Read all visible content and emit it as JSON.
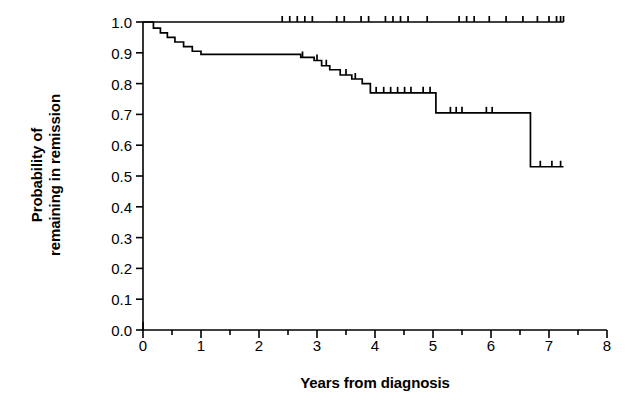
{
  "chart_data": {
    "type": "line",
    "title": "",
    "xlabel": "Years from diagnosis",
    "ylabel_lines": [
      "Probability of",
      "remaining in remission"
    ],
    "ylabel": "Probability of remaining in remission",
    "xlim": [
      0,
      8
    ],
    "ylim": [
      0.0,
      1.0
    ],
    "xticks": [
      0,
      1,
      2,
      3,
      4,
      5,
      6,
      7,
      8
    ],
    "xtick_labels": [
      "0",
      "1",
      "2",
      "3",
      "4",
      "5",
      "6",
      "7",
      "8"
    ],
    "xminor_step": 0.5,
    "yticks": [
      0.0,
      0.1,
      0.2,
      0.3,
      0.4,
      0.5,
      0.6,
      0.7,
      0.8,
      0.9,
      1.0
    ],
    "ytick_labels": [
      "0.0",
      "0.1",
      "0.2",
      "0.3",
      "0.4",
      "0.5",
      "0.6",
      "0.7",
      "0.8",
      "0.9",
      "1.0"
    ],
    "grid": false,
    "legend": "none",
    "step_style": "post",
    "line_color": "#000000",
    "series": [
      {
        "name": "upper-curve",
        "x": [
          0.0,
          7.25
        ],
        "y": [
          1.0,
          1.0
        ],
        "censor_x": [
          2.4,
          2.53,
          2.66,
          2.79,
          2.92,
          3.34,
          3.47,
          3.76,
          3.89,
          4.18,
          4.31,
          4.44,
          4.57,
          4.9,
          5.45,
          5.58,
          5.71,
          5.97,
          6.26,
          6.55,
          6.8,
          7.0,
          7.13,
          7.2,
          7.25
        ],
        "censor_y": 1.0
      },
      {
        "name": "lower-curve",
        "x": [
          0.0,
          0.18,
          0.3,
          0.42,
          0.55,
          0.7,
          0.85,
          1.0,
          2.72,
          2.95,
          3.08,
          3.22,
          3.4,
          3.6,
          3.78,
          3.92,
          5.05,
          6.68,
          7.25
        ],
        "y": [
          1.0,
          0.98,
          0.965,
          0.95,
          0.935,
          0.92,
          0.905,
          0.895,
          0.885,
          0.875,
          0.858,
          0.845,
          0.828,
          0.815,
          0.8,
          0.77,
          0.705,
          0.53,
          0.53
        ],
        "censor_x": [
          2.75,
          3.0,
          3.16,
          3.5,
          3.66,
          4.02,
          4.15,
          4.27,
          4.39,
          4.51,
          4.62,
          4.83,
          4.95,
          5.3,
          5.4,
          5.5,
          5.92,
          6.02,
          6.85,
          7.05,
          7.2
        ],
        "censor_y": null
      }
    ]
  },
  "axis": {
    "tick_color": "#000000",
    "axis_color": "#000000"
  }
}
